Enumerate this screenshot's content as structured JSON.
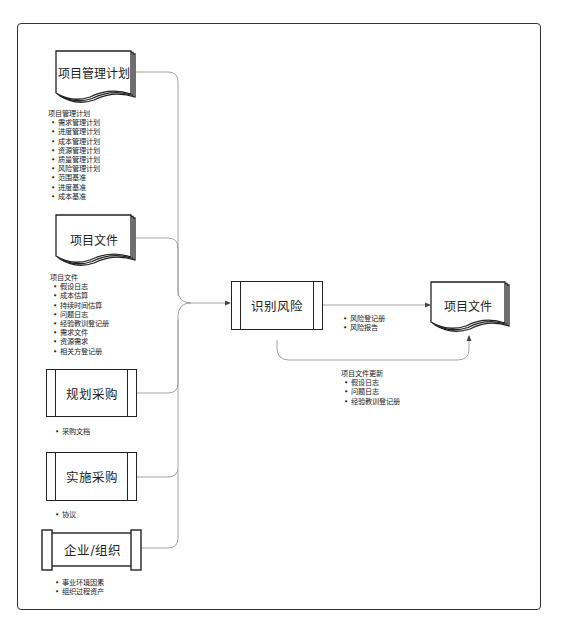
{
  "diagram": {
    "inputs": [
      {
        "id": "project-management-plan",
        "label": "项目管理计划",
        "shape": "document-stack",
        "list_title": "项目管理计划",
        "items": [
          "需求管理计划",
          "进度管理计划",
          "成本管理计划",
          "资源管理计划",
          "质量管理计划",
          "风险管理计划",
          "范围基准",
          "进度基准",
          "成本基准"
        ]
      },
      {
        "id": "project-documents",
        "label": "项目文件",
        "shape": "document-stack",
        "list_title": "项目文件",
        "items": [
          "假设日志",
          "成本估算",
          "持续时间估算",
          "问题日志",
          "经验教训登记册",
          "需求文件",
          "资源需求",
          "相关方登记册"
        ]
      },
      {
        "id": "plan-procurement",
        "label": "规划采购",
        "shape": "process",
        "items": [
          "采购文档"
        ]
      },
      {
        "id": "conduct-procurement",
        "label": "实施采购",
        "shape": "process",
        "items": [
          "协议"
        ]
      },
      {
        "id": "enterprise-org",
        "label": "企业/组织",
        "shape": "scroll",
        "items": [
          "事业环境因素",
          "组织过程资产"
        ]
      }
    ],
    "process": {
      "id": "identify-risks",
      "label": "识别风险"
    },
    "output_target": {
      "id": "project-documents-out",
      "label": "项目文件"
    },
    "output_items": [
      "风险登记册",
      "风险报告"
    ],
    "updates": {
      "title": "项目文件更新",
      "items": [
        "假设日志",
        "问题日志",
        "经验教训登记册"
      ]
    }
  },
  "colors": {
    "line": "#222222",
    "connector": "#888888",
    "frame": "#333333"
  }
}
